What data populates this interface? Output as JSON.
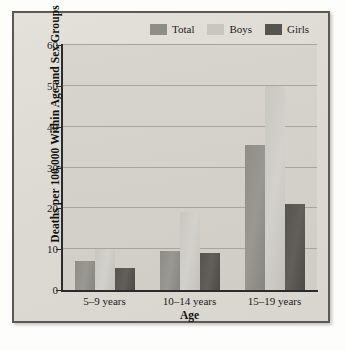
{
  "chart_data": {
    "type": "bar",
    "title": "",
    "xlabel": "Age",
    "ylabel": "Deaths per 100,000 Within Age and Sex Groups",
    "categories": [
      "5–9 years",
      "10–14 years",
      "15–19 years"
    ],
    "series": [
      {
        "name": "Total",
        "values": [
          7,
          9.5,
          35.5
        ],
        "color": "#8f8d87"
      },
      {
        "name": "Boys",
        "values": [
          10,
          19,
          50
        ],
        "color": "#c8c6c0"
      },
      {
        "name": "Girls",
        "values": [
          5.5,
          9,
          21
        ],
        "color": "#56544f"
      }
    ],
    "ylim": [
      0,
      60
    ],
    "yticks": [
      0,
      10,
      20,
      30,
      40,
      50,
      60
    ],
    "ytick_labels": [
      "0",
      "10",
      "20",
      "30",
      "40",
      "50",
      "60"
    ],
    "grid": true,
    "legend_position": "top-right"
  },
  "colors": {
    "frame_border": "#5a5954",
    "plot_background": "#d2d0c9",
    "page_background": "#fdfdfb",
    "gridline": "#a7a59e",
    "axis": "#2c2b29"
  }
}
